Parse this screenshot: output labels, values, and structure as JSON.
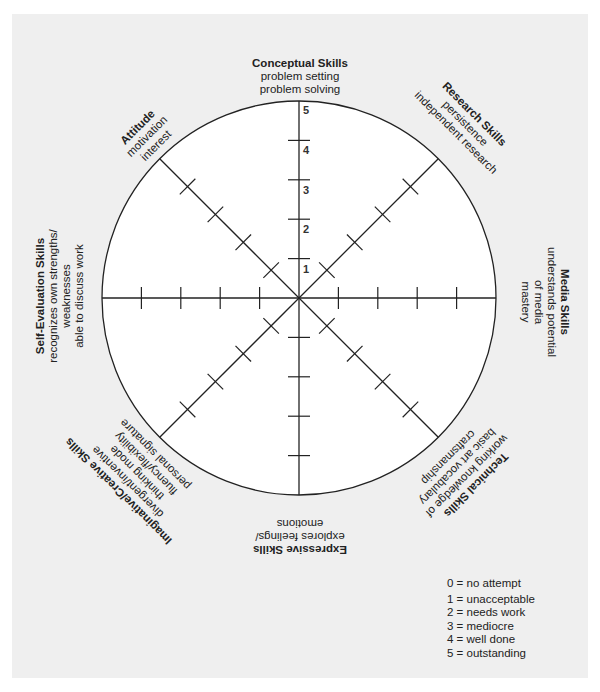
{
  "diagram": {
    "type": "assessment-wheel",
    "scale_max": 5,
    "colors": {
      "panel_bg": "#efefef",
      "circle_fill": "#ffffff",
      "line": "#222222"
    },
    "scale_labels": [
      "1",
      "2",
      "3",
      "4",
      "5"
    ],
    "categories": [
      {
        "title": "Conceptual Skills",
        "lines": [
          "problem setting",
          "problem solving"
        ]
      },
      {
        "title": "Research Skills",
        "lines": [
          "persistence",
          "independent research"
        ]
      },
      {
        "title": "Media Skills",
        "lines": [
          "understands potential",
          "of media",
          "mastery"
        ]
      },
      {
        "title": "Technical Skills",
        "lines": [
          "working knowledge of",
          "basic art vocabulary",
          "craftsmanship"
        ]
      },
      {
        "title": "Expressive Skills",
        "lines": [
          "explores feelings/",
          "emotions"
        ]
      },
      {
        "title": "Imaginative/Creative Skills",
        "lines": [
          "divergent/inventive",
          "thinking mode",
          "fluency/flexibility",
          "personal signature"
        ]
      },
      {
        "title": "Self-Evaluation Skills",
        "lines": [
          "recognizes own strengths/",
          "weaknesses",
          "able to discuss work"
        ]
      },
      {
        "title": "Attitude",
        "lines": [
          "motivation",
          "interest"
        ]
      }
    ],
    "legend": [
      "0 = no attempt",
      "1 = unacceptable",
      "2 = needs work",
      "3 = mediocre",
      "4 = well done",
      "5 = outstanding"
    ]
  }
}
